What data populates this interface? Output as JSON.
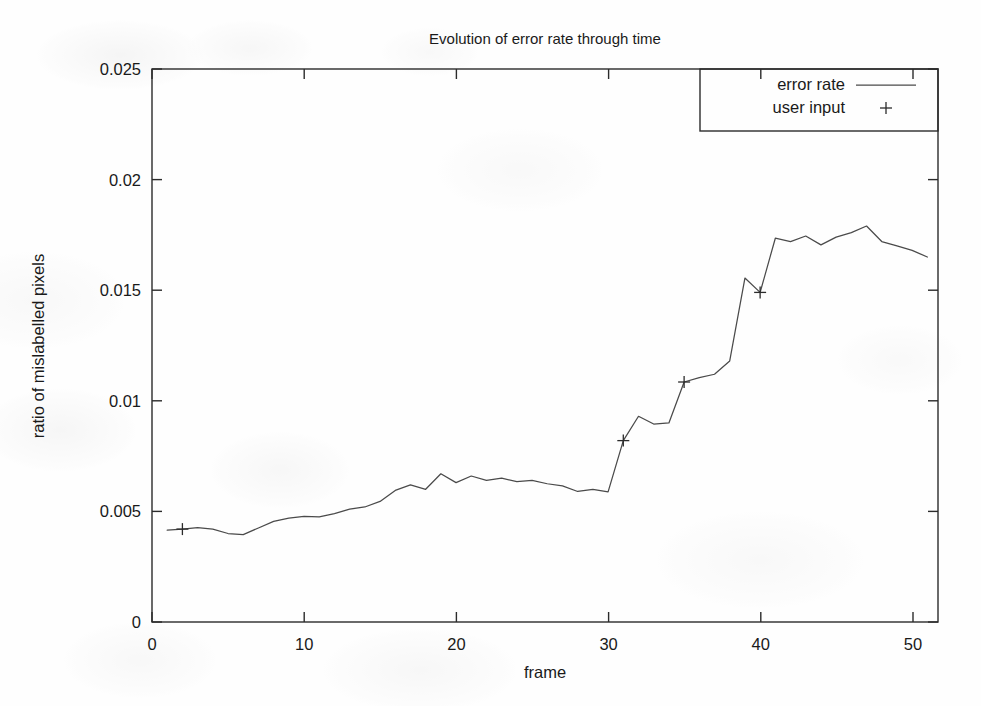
{
  "chart_data": {
    "type": "line",
    "title": "Evolution of error rate through time",
    "xlabel": "frame",
    "ylabel": "ratio of mislabelled pixels",
    "xlim": [
      0,
      51.7
    ],
    "ylim": [
      0,
      0.025
    ],
    "grid": false,
    "legend_position": "top-right",
    "xticks": [
      0,
      10,
      20,
      30,
      40,
      50
    ],
    "xtick_labels": [
      "0",
      "10",
      "20",
      "30",
      "40",
      "50"
    ],
    "yticks": [
      0,
      0.005,
      0.01,
      0.015,
      0.02,
      0.025
    ],
    "ytick_labels": [
      "0",
      "0.005",
      "0.01",
      "0.015",
      "0.02",
      "0.025"
    ],
    "series": [
      {
        "name": "error rate",
        "style": "line",
        "x": [
          1,
          2,
          3,
          4,
          5,
          6,
          7,
          8,
          9,
          10,
          11,
          12,
          13,
          14,
          15,
          16,
          17,
          18,
          19,
          20,
          21,
          22,
          23,
          24,
          25,
          26,
          27,
          28,
          29,
          30,
          31,
          32,
          33,
          34,
          35,
          36,
          37,
          38,
          39,
          40,
          41,
          42,
          43,
          44,
          45,
          46,
          47,
          48,
          49,
          50,
          51
        ],
        "y": [
          0.00415,
          0.0042,
          0.00427,
          0.0042,
          0.004,
          0.00395,
          0.00425,
          0.00455,
          0.0047,
          0.00478,
          0.00475,
          0.0049,
          0.0051,
          0.0052,
          0.00545,
          0.00595,
          0.0062,
          0.006,
          0.0067,
          0.0063,
          0.0066,
          0.0064,
          0.0065,
          0.00635,
          0.0064,
          0.00625,
          0.00615,
          0.0059,
          0.006,
          0.00588,
          0.0082,
          0.0093,
          0.00895,
          0.009,
          0.01085,
          0.01105,
          0.0112,
          0.0118,
          0.01555,
          0.0149,
          0.01735,
          0.0172,
          0.01745,
          0.01705,
          0.0174,
          0.0176,
          0.0179,
          0.0172,
          0.017,
          0.0168,
          0.0165
        ]
      },
      {
        "name": "user input",
        "style": "points",
        "marker": "+",
        "x": [
          2,
          31,
          35,
          40
        ],
        "y": [
          0.0042,
          0.0082,
          0.01085,
          0.0149
        ]
      }
    ]
  },
  "legend": {
    "entries": [
      {
        "label": "error rate",
        "sample": "line"
      },
      {
        "label": "user input",
        "sample": "plus-marker"
      }
    ]
  }
}
